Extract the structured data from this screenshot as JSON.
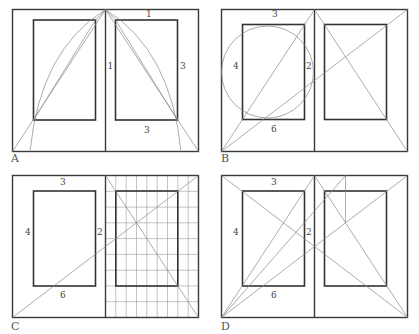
{
  "figure": {
    "panels": [
      {
        "id": "A",
        "label": "A",
        "ratio_labels": {
          "top": "1",
          "inner": "1",
          "outer": "3",
          "bottom": "3"
        }
      },
      {
        "id": "B",
        "label": "B",
        "ratio_labels": {
          "top": "3",
          "outer": "4",
          "inner": "2",
          "bottom": "6"
        }
      },
      {
        "id": "C",
        "label": "C",
        "ratio_labels": {
          "top": "3",
          "outer": "4",
          "inner": "2",
          "bottom": "6"
        },
        "grid": {
          "columns": 9,
          "rows": 9
        }
      },
      {
        "id": "D",
        "label": "D",
        "ratio_labels": {
          "top": "3",
          "outer": "4",
          "inner": "2",
          "bottom": "6"
        }
      }
    ]
  },
  "colors": {
    "frame": "#3a3a3a",
    "text_block": "#333333",
    "guide_line": "#8a8a8a",
    "background": "#ffffff"
  }
}
